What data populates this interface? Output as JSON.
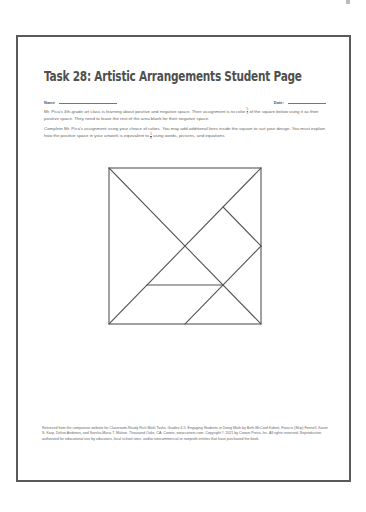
{
  "document": {
    "title": "Task 28: Artistic Arrangements Student Page",
    "name_label": "Name",
    "date_label": "Date:",
    "paragraph1": {
      "before_fraction": "Mr. Pica's 4th-grade art class is learning about positive and negative space. Their assignment is to color ",
      "fraction": {
        "numerator": "5",
        "denominator": "8"
      },
      "after_fraction": " of the square below using it as their positive space. They need to leave the rest of the area blank for their negative space."
    },
    "paragraph2": {
      "before_fraction": "Complete Mr. Pica's assignment using your choice of colors. You may add additional lines inside the square to suit your design. You must explain how the positive space in your artwork is equivalent to ",
      "fraction": {
        "numerator": "5",
        "denominator": "8"
      },
      "after_fraction": " using words, pictures, and equations."
    },
    "footer": "Retrieved from the companion website for Classroom-Ready Rich Math Tasks, Grades 4-5: Engaging Students in Doing Math by Beth McCord Kobett, Francis (Skip) Fennell, Karen S. Karp, Delise Andrews, and Sorsha-Maria T. Mulroe. Thousand Oaks, CA: Corwin, www.corwin.com. Copyright © 2021 by Corwin Press, Inc. All rights reserved. Reproduction authorized for educational use by educators, local school sites, and/or noncommercial or nonprofit entities that have purchased the book."
  },
  "diagram": {
    "type": "tangram-square",
    "units": 4,
    "stroke_color": "#555555",
    "segments": [
      {
        "from": [
          0,
          0
        ],
        "to": [
          4,
          4
        ],
        "desc": "main diagonal top-left to bottom-right"
      },
      {
        "from": [
          0,
          4
        ],
        "to": [
          4,
          0
        ],
        "desc": "diagonal bottom-left to top-right"
      },
      {
        "from": [
          3,
          1
        ],
        "to": [
          4,
          2
        ],
        "desc": "square piece edge to right midpoint"
      },
      {
        "from": [
          4,
          2
        ],
        "to": [
          2,
          4
        ],
        "desc": "right midpoint to bottom midpoint"
      },
      {
        "from": [
          1,
          3
        ],
        "to": [
          3,
          3
        ],
        "desc": "horizontal segment"
      }
    ]
  }
}
